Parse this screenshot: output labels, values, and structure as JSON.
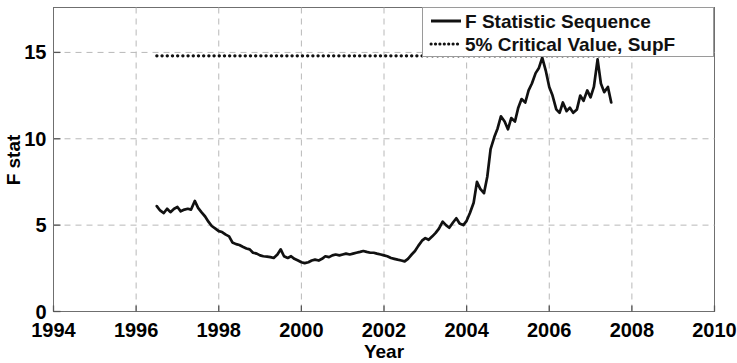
{
  "chart_data": {
    "type": "line",
    "title": "",
    "xlabel": "Year",
    "ylabel": "F stat",
    "xlim": [
      1994,
      2010
    ],
    "ylim": [
      0,
      17.6
    ],
    "xticks": [
      1994,
      1996,
      1998,
      2000,
      2002,
      2004,
      2006,
      2008,
      2010
    ],
    "xtick_labels": [
      "1994",
      "1996",
      "1998",
      "2000",
      "2002",
      "2004",
      "2006",
      "2008",
      "2010"
    ],
    "yticks": [
      0,
      5,
      10,
      15
    ],
    "ytick_labels": [
      "0",
      "5",
      "10",
      "15"
    ],
    "grid": true,
    "grid_style": "dashed",
    "legend_position": "top-right",
    "line_color": "#111111",
    "series": [
      {
        "name": "F Statistic Sequence",
        "style": "solid",
        "x": [
          1996.5,
          1996.58,
          1996.67,
          1996.75,
          1996.83,
          1996.92,
          1997.0,
          1997.08,
          1997.17,
          1997.25,
          1997.33,
          1997.42,
          1997.5,
          1997.58,
          1997.67,
          1997.75,
          1997.83,
          1997.92,
          1998.0,
          1998.08,
          1998.17,
          1998.25,
          1998.33,
          1998.42,
          1998.5,
          1998.58,
          1998.67,
          1998.75,
          1998.83,
          1998.92,
          1999.0,
          1999.08,
          1999.17,
          1999.25,
          1999.33,
          1999.42,
          1999.5,
          1999.58,
          1999.67,
          1999.75,
          1999.83,
          1999.92,
          2000.0,
          2000.08,
          2000.17,
          2000.25,
          2000.33,
          2000.42,
          2000.5,
          2000.58,
          2000.67,
          2000.75,
          2000.83,
          2000.92,
          2001.0,
          2001.08,
          2001.17,
          2001.25,
          2001.33,
          2001.42,
          2001.5,
          2001.58,
          2001.67,
          2001.75,
          2001.83,
          2001.92,
          2002.0,
          2002.08,
          2002.17,
          2002.25,
          2002.33,
          2002.42,
          2002.5,
          2002.58,
          2002.67,
          2002.75,
          2002.83,
          2002.92,
          2003.0,
          2003.08,
          2003.17,
          2003.25,
          2003.33,
          2003.42,
          2003.5,
          2003.58,
          2003.67,
          2003.75,
          2003.83,
          2003.92,
          2004.0,
          2004.08,
          2004.17,
          2004.25,
          2004.33,
          2004.42,
          2004.5,
          2004.58,
          2004.67,
          2004.75,
          2004.83,
          2004.92,
          2005.0,
          2005.08,
          2005.17,
          2005.25,
          2005.33,
          2005.42,
          2005.5,
          2005.58,
          2005.67,
          2005.75,
          2005.83,
          2005.92,
          2006.0,
          2006.08,
          2006.17,
          2006.25,
          2006.33,
          2006.42,
          2006.5,
          2006.58,
          2006.67,
          2006.75,
          2006.83,
          2006.92,
          2007.0,
          2007.08,
          2007.17,
          2007.25,
          2007.33,
          2007.42,
          2007.5
        ],
        "y": [
          6.1,
          5.85,
          5.7,
          5.95,
          5.75,
          5.95,
          6.05,
          5.8,
          5.9,
          5.95,
          5.9,
          6.4,
          6.0,
          5.75,
          5.5,
          5.2,
          4.95,
          4.8,
          4.65,
          4.6,
          4.45,
          4.35,
          4.0,
          3.9,
          3.85,
          3.75,
          3.65,
          3.6,
          3.4,
          3.35,
          3.25,
          3.2,
          3.18,
          3.15,
          3.1,
          3.3,
          3.6,
          3.2,
          3.1,
          3.2,
          3.05,
          2.95,
          2.85,
          2.8,
          2.85,
          2.95,
          3.0,
          2.95,
          3.05,
          3.2,
          3.15,
          3.25,
          3.3,
          3.25,
          3.3,
          3.35,
          3.3,
          3.35,
          3.4,
          3.45,
          3.5,
          3.45,
          3.4,
          3.4,
          3.35,
          3.3,
          3.25,
          3.2,
          3.1,
          3.05,
          3.0,
          2.95,
          2.9,
          3.05,
          3.3,
          3.5,
          3.8,
          4.1,
          4.25,
          4.15,
          4.35,
          4.55,
          4.8,
          5.2,
          5.0,
          4.85,
          5.15,
          5.4,
          5.1,
          5.0,
          5.25,
          5.7,
          6.3,
          7.5,
          7.1,
          6.85,
          7.8,
          9.4,
          10.1,
          10.6,
          11.3,
          11.0,
          10.55,
          11.2,
          11.0,
          11.8,
          12.3,
          12.1,
          12.8,
          13.2,
          13.8,
          14.1,
          14.7,
          13.9,
          13.0,
          12.5,
          11.7,
          11.5,
          12.1,
          11.6,
          11.8,
          11.5,
          11.7,
          12.5,
          12.2,
          12.8,
          12.4,
          13.0,
          14.6,
          13.2,
          12.7,
          13.0,
          12.1
        ]
      },
      {
        "name": "5% Critical Value, SupF",
        "style": "dotted",
        "value": 14.8,
        "x_start": 1996.5,
        "x_end": 2007.5
      }
    ]
  },
  "legend": {
    "entries": [
      {
        "label": "F Statistic Sequence",
        "marker": "solid-line"
      },
      {
        "label": "5% Critical Value, SupF",
        "marker": "dotted-line"
      }
    ]
  },
  "axes": {
    "x_title": "Year",
    "y_title": "F stat"
  }
}
